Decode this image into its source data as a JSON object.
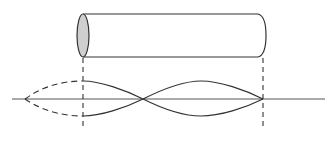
{
  "diagram": {
    "description": "Cylindrical tube (resonator) above a standing-wave pattern with an extended dashed antinode at the open end",
    "colors": {
      "stroke": "#333333",
      "ellipse_fill": "#cfcfcf",
      "background": "#ffffff"
    },
    "tube": {
      "left_x": 83,
      "right_x": 262,
      "top_y": 14,
      "bottom_y": 57,
      "end_rx": 6,
      "open_end": "left (shaded ellipse)",
      "closed_end": "right (rounded cap)"
    },
    "axis": {
      "y": 99,
      "x_start": 12,
      "x_end": 325
    },
    "guides": [
      {
        "name": "left-end-guide",
        "x": 83,
        "y_start": 57,
        "y_end": 128,
        "style": "dashed"
      },
      {
        "name": "right-end-guide",
        "x": 263,
        "y_start": 57,
        "y_end": 128,
        "style": "dashed"
      }
    ],
    "standing_wave": {
      "end_correction_apex_x": 25,
      "node_x": 143,
      "closed_end_node_x": 263,
      "amplitude_top_y": 81,
      "amplitude_bottom_y": 116,
      "segments": [
        "dashed end-correction lobe",
        "solid lobe 1",
        "solid lobe 2"
      ]
    }
  }
}
